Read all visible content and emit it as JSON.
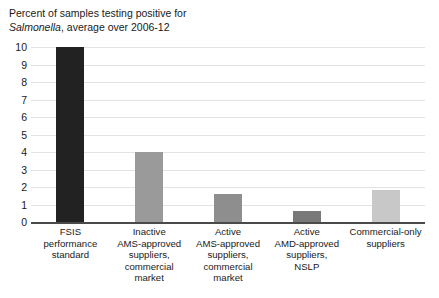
{
  "chart_data": {
    "type": "bar",
    "title_line1": "Percent of samples testing positive for",
    "title_line2_italic": "Salmonella",
    "title_line2_rest": ", average over 2006-12",
    "xlabel": "",
    "ylabel": "",
    "ylim": [
      0,
      10
    ],
    "ytick_step": 1,
    "ytick_labels": [
      "10",
      "9",
      "8",
      "7",
      "6",
      "5",
      "4",
      "3",
      "2",
      "1",
      "0"
    ],
    "ytick_values": [
      10,
      9,
      8,
      7,
      6,
      5,
      4,
      3,
      2,
      1,
      0
    ],
    "grid": true,
    "legend": "none",
    "categories": [
      "FSIS performance standard",
      "Inactive AMS-approved suppliers, commercial market",
      "Active AMS-approved suppliers, commercial market",
      "Active AMD-approved suppliers, NSLP",
      "Commercial-only suppliers"
    ],
    "category_lines": [
      "FSIS\nperformance\nstandard",
      "Inactive\nAMS-approved\nsuppliers,\ncommercial\nmarket",
      "Active\nAMS-approved\nsuppliers,\ncommercial\nmarket",
      "Active\nAMD-approved\nsuppliers,\nNSLP",
      "Commercial-only\nsuppliers"
    ],
    "values": [
      10.0,
      4.0,
      1.6,
      0.65,
      1.85
    ],
    "bar_colors": [
      "#222222",
      "#9a9a9a",
      "#8e8e8e",
      "#787878",
      "#c8c8c8"
    ],
    "colors": {
      "gridline": "#e3e3e3",
      "axis": "#4a4a4a",
      "text": "#1a1a1a",
      "background": "#ffffff"
    }
  }
}
